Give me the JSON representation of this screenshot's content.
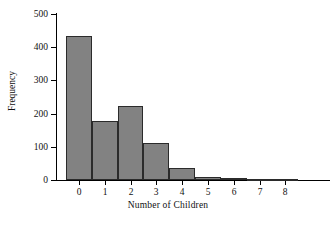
{
  "chart_data": {
    "type": "bar",
    "title": "",
    "subtitle": "",
    "xlabel": "Number of Children",
    "ylabel": "Frequency",
    "categories": [
      "0",
      "1",
      "2",
      "3",
      "4",
      "5",
      "6",
      "7",
      "8"
    ],
    "values": [
      434,
      178,
      222,
      111,
      36,
      10,
      5,
      1,
      2
    ],
    "x": [
      0,
      1,
      2,
      3,
      4,
      5,
      6,
      7,
      8
    ],
    "xlim": [
      -0.5,
      8.5
    ],
    "ylim": [
      0,
      500
    ],
    "yticks": [
      0,
      100,
      200,
      300,
      400,
      500
    ],
    "ytick_labels": [
      "0",
      "100",
      "200",
      "300",
      "400",
      "500"
    ],
    "xticks": [
      0,
      1,
      2,
      3,
      4,
      5,
      6,
      7,
      8
    ],
    "xtick_labels": [
      "0",
      "1",
      "2",
      "3",
      "4",
      "5",
      "6",
      "7",
      "8"
    ],
    "grid": false,
    "legend": null,
    "legend_position": "none",
    "bar_fill_color": "#828282",
    "bar_edge_color": "#2b2b2b",
    "axis_color": "#000000",
    "background_color": "#ffffff",
    "bin_width": 1,
    "annotations": []
  }
}
